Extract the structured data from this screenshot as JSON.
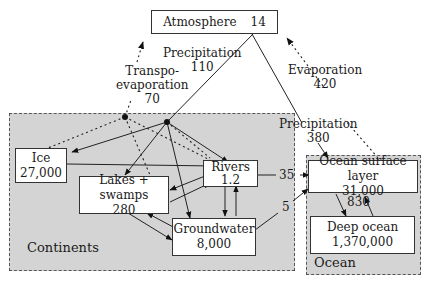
{
  "regions": {
    "continents": "Continents",
    "ocean": "Ocean"
  },
  "nodes": {
    "atmosphere": {
      "name": "Atmosphere",
      "value": "14"
    },
    "ice": {
      "name": "Ice",
      "value": "27,000"
    },
    "lakes": {
      "name": "Lakes + swamps",
      "value": "280"
    },
    "rivers": {
      "name": "Rivers",
      "value": "1.2"
    },
    "groundwater": {
      "name": "Groundwater",
      "value": "8,000"
    },
    "ocean_surface": {
      "name": "Ocean surface layer",
      "value": "31,000"
    },
    "deep_ocean": {
      "name": "Deep ocean",
      "value": "1,370,000"
    }
  },
  "flows": {
    "precip_land": {
      "label": "Precipitation",
      "value": "110"
    },
    "transpo": {
      "label1": "Transpo-",
      "label2": "evaporation",
      "value": "70"
    },
    "evap_ocean": {
      "label": "Evaporation",
      "value": "420"
    },
    "precip_ocean": {
      "label": "Precipitation",
      "value": "380"
    },
    "rivers_to_ocean": "35",
    "groundwater_to_ocean": "5",
    "ocean_exchange": "830"
  }
}
